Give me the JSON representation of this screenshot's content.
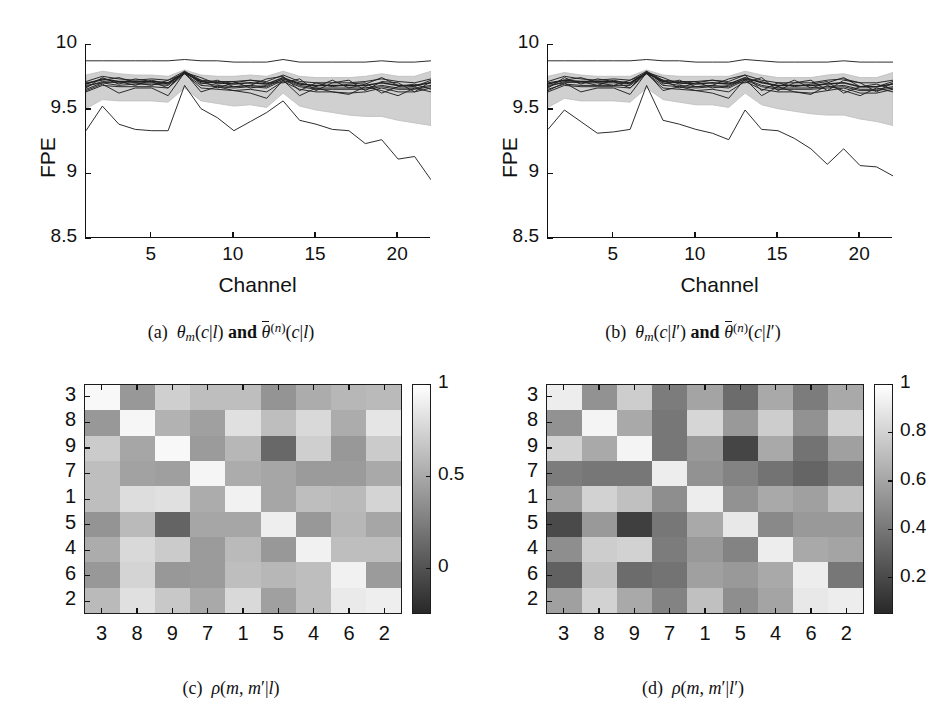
{
  "figure": {
    "panels": [
      "a",
      "b",
      "c",
      "d"
    ]
  },
  "captions": {
    "a": {
      "tag": "(a)",
      "text": "θm(c|l) and θ̄(n)(c|l)"
    },
    "b": {
      "tag": "(b)",
      "text": "θm(c|l′) and θ̄(n)(c|l′)"
    },
    "c": {
      "tag": "(c)",
      "text": "ρ(m, m′|l)"
    },
    "d": {
      "tag": "(d)",
      "text": "ρ(m, m′|l′)"
    }
  },
  "chart_data": [
    {
      "id": "panel-a",
      "type": "line",
      "title": "",
      "xlabel": "Channel",
      "ylabel": "FPE",
      "xlim": [
        1,
        22
      ],
      "ylim": [
        8.5,
        10
      ],
      "xticks": [
        5,
        10,
        15,
        20
      ],
      "yticks": [
        8.5,
        9,
        9.5,
        10
      ],
      "xticklabels": [
        "5",
        "10",
        "15",
        "20"
      ],
      "yticklabels": [
        "8.5",
        "9",
        "9.5",
        "10"
      ],
      "grid": false,
      "legend": false,
      "x": [
        1,
        2,
        3,
        4,
        5,
        6,
        7,
        8,
        9,
        10,
        11,
        12,
        13,
        14,
        15,
        16,
        17,
        18,
        19,
        20,
        21,
        22
      ],
      "band": {
        "name": "theta-bar-ensemble-spread",
        "upper": [
          9.76,
          9.79,
          9.77,
          9.76,
          9.76,
          9.75,
          9.8,
          9.76,
          9.75,
          9.75,
          9.76,
          9.75,
          9.79,
          9.75,
          9.74,
          9.74,
          9.74,
          9.75,
          9.77,
          9.75,
          9.75,
          9.79
        ],
        "lower": [
          9.5,
          9.57,
          9.56,
          9.56,
          9.56,
          9.55,
          9.66,
          9.56,
          9.54,
          9.52,
          9.53,
          9.51,
          9.62,
          9.52,
          9.49,
          9.47,
          9.45,
          9.44,
          9.44,
          9.41,
          9.39,
          9.37
        ]
      },
      "series": [
        {
          "name": "top-envelope",
          "values": [
            9.87,
            9.87,
            9.87,
            9.87,
            9.87,
            9.87,
            9.88,
            9.87,
            9.87,
            9.86,
            9.86,
            9.86,
            9.88,
            9.86,
            9.86,
            9.86,
            9.86,
            9.86,
            9.87,
            9.86,
            9.86,
            9.87
          ]
        },
        {
          "name": "theta-bar-n",
          "values": [
            9.69,
            9.73,
            9.71,
            9.71,
            9.71,
            9.7,
            9.78,
            9.71,
            9.7,
            9.69,
            9.7,
            9.69,
            9.74,
            9.69,
            9.68,
            9.68,
            9.68,
            9.68,
            9.7,
            9.68,
            9.68,
            9.7
          ]
        },
        {
          "name": "theta-m-1",
          "values": [
            9.67,
            9.71,
            9.7,
            9.7,
            9.7,
            9.69,
            9.78,
            9.7,
            9.68,
            9.67,
            9.68,
            9.67,
            9.73,
            9.68,
            9.66,
            9.66,
            9.66,
            9.66,
            9.68,
            9.66,
            9.66,
            9.68
          ]
        },
        {
          "name": "theta-m-2",
          "values": [
            9.65,
            9.7,
            9.68,
            9.69,
            9.69,
            9.68,
            9.77,
            9.68,
            9.67,
            9.66,
            9.67,
            9.66,
            9.72,
            9.67,
            9.65,
            9.65,
            9.65,
            9.65,
            9.67,
            9.65,
            9.65,
            9.67
          ]
        },
        {
          "name": "theta-m-3",
          "values": [
            9.71,
            9.75,
            9.73,
            9.72,
            9.73,
            9.72,
            9.79,
            9.72,
            9.71,
            9.71,
            9.72,
            9.71,
            9.76,
            9.71,
            9.7,
            9.7,
            9.7,
            9.71,
            9.73,
            9.71,
            9.7,
            9.73
          ]
        },
        {
          "name": "theta-m-4",
          "values": [
            9.63,
            9.68,
            9.67,
            9.67,
            9.67,
            9.66,
            9.77,
            9.66,
            9.65,
            9.64,
            9.65,
            9.63,
            9.71,
            9.65,
            9.63,
            9.63,
            9.62,
            9.63,
            9.66,
            9.63,
            9.63,
            9.66
          ]
        },
        {
          "name": "theta-m-5",
          "values": [
            9.64,
            9.69,
            9.62,
            9.66,
            9.66,
            9.6,
            9.78,
            9.63,
            9.67,
            9.64,
            9.62,
            9.58,
            9.72,
            9.6,
            9.66,
            9.63,
            9.61,
            9.67,
            9.64,
            9.6,
            9.66,
            9.63
          ]
        },
        {
          "name": "theta-m-6",
          "values": [
            9.7,
            9.72,
            9.74,
            9.7,
            9.68,
            9.72,
            9.77,
            9.72,
            9.66,
            9.7,
            9.72,
            9.7,
            9.7,
            9.73,
            9.64,
            9.7,
            9.72,
            9.64,
            9.71,
            9.7,
            9.63,
            9.71
          ]
        },
        {
          "name": "theta-m-7",
          "values": [
            9.66,
            9.74,
            9.69,
            9.73,
            9.71,
            9.66,
            9.79,
            9.69,
            9.72,
            9.67,
            9.68,
            9.73,
            9.75,
            9.64,
            9.7,
            9.67,
            9.69,
            9.7,
            9.62,
            9.67,
            9.69,
            9.65
          ]
        },
        {
          "name": "theta-m-8",
          "values": [
            9.68,
            9.7,
            9.71,
            9.68,
            9.72,
            9.69,
            9.78,
            9.74,
            9.69,
            9.71,
            9.66,
            9.68,
            9.73,
            9.7,
            9.67,
            9.72,
            9.66,
            9.69,
            9.74,
            9.68,
            9.67,
            9.72
          ]
        },
        {
          "name": "bottom-outlier",
          "values": [
            9.33,
            9.52,
            9.38,
            9.34,
            9.33,
            9.33,
            9.68,
            9.5,
            9.43,
            9.33,
            9.4,
            9.47,
            9.56,
            9.41,
            9.38,
            9.34,
            9.33,
            9.23,
            9.26,
            9.11,
            9.13,
            8.95
          ]
        }
      ]
    },
    {
      "id": "panel-b",
      "type": "line",
      "title": "",
      "xlabel": "Channel",
      "ylabel": "FPE",
      "xlim": [
        1,
        22
      ],
      "ylim": [
        8.5,
        10
      ],
      "xticks": [
        5,
        10,
        15,
        20
      ],
      "yticks": [
        8.5,
        9,
        9.5,
        10
      ],
      "xticklabels": [
        "5",
        "10",
        "15",
        "20"
      ],
      "yticklabels": [
        "8.5",
        "9",
        "9.5",
        "10"
      ],
      "grid": false,
      "legend": false,
      "x": [
        1,
        2,
        3,
        4,
        5,
        6,
        7,
        8,
        9,
        10,
        11,
        12,
        13,
        14,
        15,
        16,
        17,
        18,
        19,
        20,
        21,
        22
      ],
      "band": {
        "name": "theta-bar-ensemble-spread",
        "upper": [
          9.75,
          9.78,
          9.76,
          9.75,
          9.75,
          9.75,
          9.8,
          9.76,
          9.75,
          9.75,
          9.75,
          9.75,
          9.79,
          9.76,
          9.74,
          9.74,
          9.74,
          9.76,
          9.77,
          9.74,
          9.74,
          9.78
        ],
        "lower": [
          9.51,
          9.58,
          9.56,
          9.56,
          9.56,
          9.55,
          9.66,
          9.57,
          9.55,
          9.53,
          9.53,
          9.51,
          9.62,
          9.53,
          9.5,
          9.48,
          9.46,
          9.45,
          9.45,
          9.42,
          9.4,
          9.37
        ]
      },
      "series": [
        {
          "name": "top-envelope",
          "values": [
            9.87,
            9.87,
            9.87,
            9.87,
            9.87,
            9.87,
            9.88,
            9.87,
            9.87,
            9.86,
            9.86,
            9.86,
            9.88,
            9.87,
            9.86,
            9.86,
            9.86,
            9.86,
            9.87,
            9.86,
            9.86,
            9.86
          ]
        },
        {
          "name": "theta-bar-n",
          "values": [
            9.69,
            9.72,
            9.71,
            9.71,
            9.71,
            9.7,
            9.78,
            9.71,
            9.7,
            9.69,
            9.7,
            9.69,
            9.74,
            9.7,
            9.68,
            9.68,
            9.68,
            9.69,
            9.7,
            9.67,
            9.67,
            9.69
          ]
        },
        {
          "name": "theta-m-1",
          "values": [
            9.67,
            9.71,
            9.7,
            9.7,
            9.7,
            9.69,
            9.78,
            9.7,
            9.68,
            9.67,
            9.68,
            9.67,
            9.73,
            9.68,
            9.66,
            9.66,
            9.66,
            9.67,
            9.68,
            9.65,
            9.65,
            9.67
          ]
        },
        {
          "name": "theta-m-2",
          "values": [
            9.65,
            9.69,
            9.68,
            9.68,
            9.68,
            9.68,
            9.77,
            9.68,
            9.67,
            9.66,
            9.67,
            9.66,
            9.72,
            9.67,
            9.65,
            9.65,
            9.65,
            9.66,
            9.67,
            9.64,
            9.64,
            9.66
          ]
        },
        {
          "name": "theta-m-3",
          "values": [
            9.71,
            9.75,
            9.73,
            9.72,
            9.73,
            9.72,
            9.79,
            9.72,
            9.71,
            9.71,
            9.72,
            9.71,
            9.76,
            9.72,
            9.7,
            9.7,
            9.7,
            9.72,
            9.73,
            9.7,
            9.7,
            9.72
          ]
        },
        {
          "name": "theta-m-4",
          "values": [
            9.63,
            9.68,
            9.67,
            9.67,
            9.67,
            9.66,
            9.77,
            9.66,
            9.65,
            9.64,
            9.65,
            9.63,
            9.71,
            9.65,
            9.63,
            9.63,
            9.62,
            9.64,
            9.66,
            9.62,
            9.62,
            9.65
          ]
        },
        {
          "name": "theta-m-5",
          "values": [
            9.64,
            9.7,
            9.63,
            9.66,
            9.66,
            9.61,
            9.78,
            9.64,
            9.67,
            9.64,
            9.62,
            9.58,
            9.73,
            9.6,
            9.67,
            9.63,
            9.61,
            9.68,
            9.64,
            9.6,
            9.66,
            9.63
          ]
        },
        {
          "name": "theta-m-6",
          "values": [
            9.7,
            9.72,
            9.74,
            9.7,
            9.68,
            9.72,
            9.77,
            9.72,
            9.66,
            9.7,
            9.72,
            9.7,
            9.7,
            9.74,
            9.64,
            9.7,
            9.72,
            9.64,
            9.72,
            9.7,
            9.63,
            9.7
          ]
        },
        {
          "name": "theta-m-7",
          "values": [
            9.66,
            9.74,
            9.69,
            9.73,
            9.71,
            9.66,
            9.79,
            9.69,
            9.72,
            9.67,
            9.68,
            9.73,
            9.76,
            9.64,
            9.7,
            9.67,
            9.69,
            9.71,
            9.62,
            9.67,
            9.69,
            9.65
          ]
        },
        {
          "name": "theta-m-8",
          "values": [
            9.68,
            9.7,
            9.71,
            9.68,
            9.72,
            9.69,
            9.78,
            9.74,
            9.69,
            9.71,
            9.66,
            9.68,
            9.73,
            9.71,
            9.67,
            9.72,
            9.66,
            9.7,
            9.74,
            9.67,
            9.67,
            9.71
          ]
        },
        {
          "name": "bottom-outlier",
          "values": [
            9.34,
            9.49,
            9.4,
            9.31,
            9.32,
            9.34,
            9.68,
            9.41,
            9.38,
            9.34,
            9.31,
            9.26,
            9.49,
            9.34,
            9.33,
            9.27,
            9.19,
            9.07,
            9.19,
            9.06,
            9.05,
            8.98
          ]
        }
      ]
    },
    {
      "id": "panel-c",
      "type": "heatmap",
      "title": "",
      "xlabel": "",
      "ylabel": "",
      "xticklabels": [
        "3",
        "8",
        "9",
        "7",
        "1",
        "5",
        "4",
        "6",
        "2"
      ],
      "yticklabels": [
        "3",
        "8",
        "9",
        "7",
        "1",
        "5",
        "4",
        "6",
        "2"
      ],
      "colorbar": {
        "ticks": [
          0,
          0.5,
          1
        ],
        "ticklabels": [
          "0",
          "0.5",
          "1"
        ],
        "vmin": -0.25,
        "vmax": 1.0,
        "position": "right",
        "cmap": "gray"
      },
      "values": [
        [
          0.96,
          0.4,
          0.72,
          0.62,
          0.62,
          0.38,
          0.52,
          0.58,
          0.6
        ],
        [
          0.4,
          0.95,
          0.55,
          0.45,
          0.82,
          0.62,
          0.78,
          0.52,
          0.85
        ],
        [
          0.7,
          0.48,
          0.96,
          0.42,
          0.58,
          0.12,
          0.72,
          0.4,
          0.7
        ],
        [
          0.62,
          0.46,
          0.44,
          0.94,
          0.52,
          0.48,
          0.42,
          0.42,
          0.5
        ],
        [
          0.62,
          0.8,
          0.82,
          0.52,
          0.92,
          0.48,
          0.62,
          0.6,
          0.75
        ],
        [
          0.38,
          0.6,
          0.1,
          0.48,
          0.48,
          0.9,
          0.4,
          0.58,
          0.48
        ],
        [
          0.52,
          0.78,
          0.7,
          0.42,
          0.6,
          0.4,
          0.92,
          0.62,
          0.62
        ],
        [
          0.4,
          0.75,
          0.4,
          0.42,
          0.62,
          0.58,
          0.62,
          0.92,
          0.42
        ],
        [
          0.6,
          0.82,
          0.68,
          0.5,
          0.78,
          0.45,
          0.62,
          0.88,
          0.9
        ]
      ]
    },
    {
      "id": "panel-d",
      "type": "heatmap",
      "title": "",
      "xlabel": "",
      "ylabel": "",
      "xticklabels": [
        "3",
        "8",
        "9",
        "7",
        "1",
        "5",
        "4",
        "6",
        "2"
      ],
      "yticklabels": [
        "3",
        "8",
        "9",
        "7",
        "1",
        "5",
        "4",
        "6",
        "2"
      ],
      "colorbar": {
        "ticks": [
          0.2,
          0.4,
          0.6,
          0.8,
          1
        ],
        "ticklabels": [
          "0.2",
          "0.4",
          "0.6",
          "0.8",
          "1"
        ],
        "vmin": 0.05,
        "vmax": 1.0,
        "position": "right",
        "cmap": "gray"
      },
      "values": [
        [
          0.92,
          0.52,
          0.78,
          0.42,
          0.6,
          0.35,
          0.62,
          0.42,
          0.62
        ],
        [
          0.52,
          0.95,
          0.62,
          0.4,
          0.82,
          0.55,
          0.78,
          0.52,
          0.8
        ],
        [
          0.8,
          0.62,
          0.95,
          0.4,
          0.55,
          0.18,
          0.62,
          0.38,
          0.58
        ],
        [
          0.42,
          0.4,
          0.4,
          0.92,
          0.52,
          0.45,
          0.38,
          0.32,
          0.42
        ],
        [
          0.58,
          0.8,
          0.72,
          0.5,
          0.92,
          0.52,
          0.62,
          0.58,
          0.72
        ],
        [
          0.2,
          0.55,
          0.15,
          0.4,
          0.62,
          0.9,
          0.48,
          0.55,
          0.55
        ],
        [
          0.5,
          0.78,
          0.8,
          0.42,
          0.55,
          0.45,
          0.92,
          0.62,
          0.6
        ],
        [
          0.3,
          0.72,
          0.35,
          0.38,
          0.58,
          0.55,
          0.62,
          0.92,
          0.4
        ],
        [
          0.58,
          0.8,
          0.62,
          0.45,
          0.72,
          0.5,
          0.6,
          0.9,
          0.92
        ]
      ]
    }
  ]
}
